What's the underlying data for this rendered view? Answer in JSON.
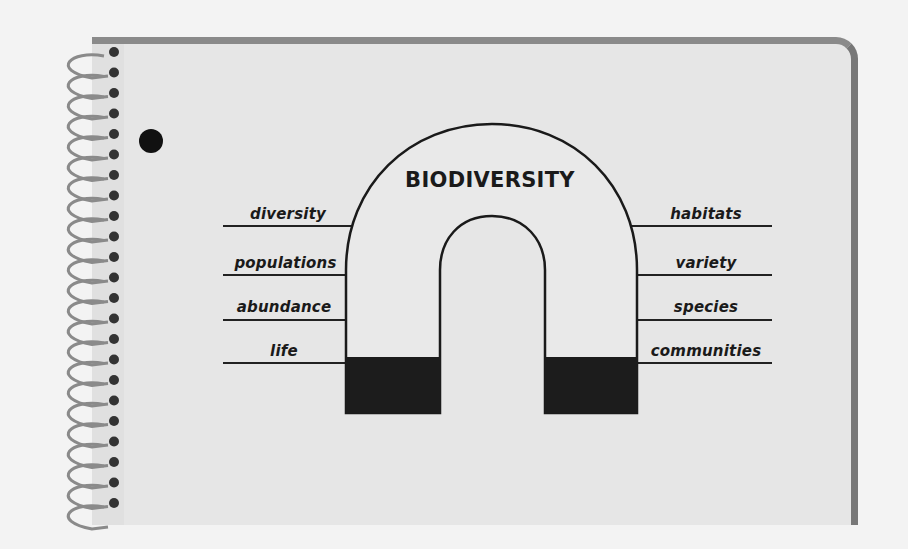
{
  "diagram": {
    "title": "BIODIVERSITY",
    "type": "horseshoe-magnet",
    "left_terms": [
      {
        "label": "diversity"
      },
      {
        "label": "populations"
      },
      {
        "label": "abundance"
      },
      {
        "label": "life"
      }
    ],
    "right_terms": [
      {
        "label": "habitats"
      },
      {
        "label": "variety"
      },
      {
        "label": "species"
      },
      {
        "label": "communities"
      }
    ]
  },
  "notebook": {
    "spiral_rings": 23,
    "binder_hole": true
  },
  "colors": {
    "page": "#e6e6e6",
    "background": "#f3f3f3",
    "ink": "#1a1a1a",
    "border": "#808080"
  }
}
